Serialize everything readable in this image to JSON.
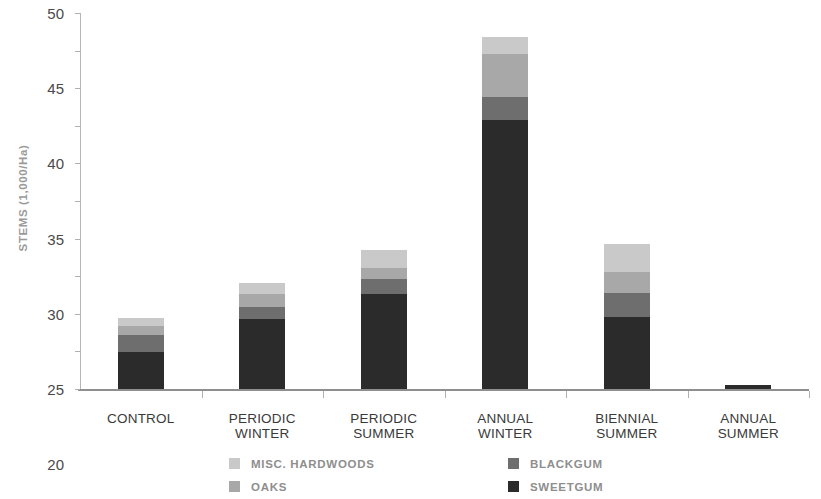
{
  "chart_data": {
    "type": "bar",
    "stacked": true,
    "title": "",
    "xlabel": "",
    "ylabel": "STEMS (1,000/Ha)",
    "ylim": [
      0,
      50
    ],
    "ytick_step": 5,
    "ytick_labels": [
      "50",
      "45",
      "40",
      "35",
      "30",
      "25",
      "20",
      "15",
      "10",
      "5",
      "0"
    ],
    "grid": false,
    "legend_position": "bottom",
    "categories": [
      "CONTROL",
      "PERIODIC WINTER",
      "PERIODIC SUMMER",
      "ANNUAL WINTER",
      "BIENNIAL SUMMER",
      "ANNUAL SUMMER"
    ],
    "category_lines": [
      [
        "CONTROL"
      ],
      [
        "PERIODIC",
        "WINTER"
      ],
      [
        "PERIODIC",
        "SUMMER"
      ],
      [
        "ANNUAL",
        "WINTER"
      ],
      [
        "BIENNIAL",
        "SUMMER"
      ],
      [
        "ANNUAL",
        "SUMMER"
      ]
    ],
    "series": [
      {
        "name": "SWEETGUM",
        "color": "#2b2b2b",
        "values": [
          4.9,
          9.3,
          12.6,
          35.8,
          9.6,
          0.5
        ]
      },
      {
        "name": "BLACKGUM",
        "color": "#6e6e6e",
        "values": [
          2.3,
          1.6,
          2.0,
          3.0,
          3.2,
          0.0
        ]
      },
      {
        "name": "OAKS",
        "color": "#a8a8a8",
        "values": [
          1.2,
          1.7,
          1.5,
          5.7,
          2.8,
          0.0
        ]
      },
      {
        "name": "MISC. HARDWOODS",
        "color": "#c9c9c9",
        "values": [
          1.1,
          1.5,
          2.4,
          2.3,
          3.7,
          0.0
        ]
      }
    ],
    "totals": [
      9.5,
      14.1,
      18.5,
      46.8,
      19.3,
      0.5
    ]
  },
  "legend": {
    "entries": [
      {
        "label": "MISC. HARDWOODS",
        "color": "#c9c9c9"
      },
      {
        "label": "BLACKGUM",
        "color": "#6e6e6e"
      },
      {
        "label": "OAKS",
        "color": "#a8a8a8"
      },
      {
        "label": "SWEETGUM",
        "color": "#2b2b2b"
      }
    ]
  },
  "axes": {
    "y_title": "STEMS (1,000/Ha)"
  }
}
